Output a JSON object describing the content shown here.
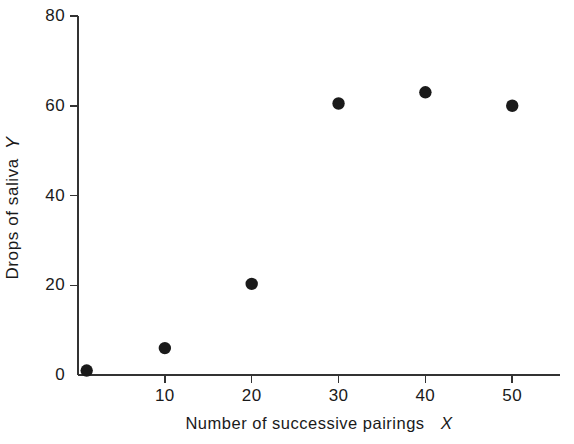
{
  "chart_data": {
    "type": "scatter",
    "title": "",
    "subtitle": "",
    "xlabel": "Number of successive pairings",
    "xlabel_var": "X",
    "ylabel": "Drops of saliva",
    "ylabel_var": "Y",
    "xlim": [
      0,
      55.5
    ],
    "ylim": [
      0,
      80
    ],
    "xticks": [
      10,
      20,
      30,
      40,
      50
    ],
    "xtick_labels": [
      "10",
      "20",
      "30",
      "40",
      "50"
    ],
    "yticks": [
      0,
      20,
      40,
      60,
      80
    ],
    "ytick_labels": [
      "0",
      "20",
      "40",
      "60",
      "80"
    ],
    "grid": false,
    "legend": false,
    "marker": "filled-circle",
    "marker_color": "#1a1a1a",
    "axis_color": "#333333",
    "background": "#ffffff",
    "x": [
      1,
      10,
      20,
      30,
      40,
      50
    ],
    "y": [
      1,
      6,
      20.3,
      60.5,
      63,
      60
    ],
    "points": [
      {
        "x": 1,
        "y": 1
      },
      {
        "x": 10,
        "y": 6
      },
      {
        "x": 20,
        "y": 20.3
      },
      {
        "x": 30,
        "y": 60.5
      },
      {
        "x": 40,
        "y": 63
      },
      {
        "x": 50,
        "y": 60
      }
    ]
  }
}
